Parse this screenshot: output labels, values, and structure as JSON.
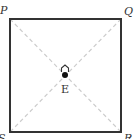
{
  "diagram": {
    "shape": "square",
    "vertices": [
      {
        "id": "P",
        "label": "P",
        "position": "top-left"
      },
      {
        "id": "Q",
        "label": "Q",
        "position": "top-right"
      },
      {
        "id": "R",
        "label": "R",
        "position": "bottom-right"
      },
      {
        "id": "S",
        "label": "S",
        "position": "bottom-left"
      }
    ],
    "center": {
      "label": "E",
      "marker": "house-icon",
      "point": "filled-dot"
    },
    "diagonals": [
      "PR",
      "QS"
    ],
    "colors": {
      "outline": "#333333",
      "diagonal": "#cccccc",
      "label": "#333333"
    }
  }
}
